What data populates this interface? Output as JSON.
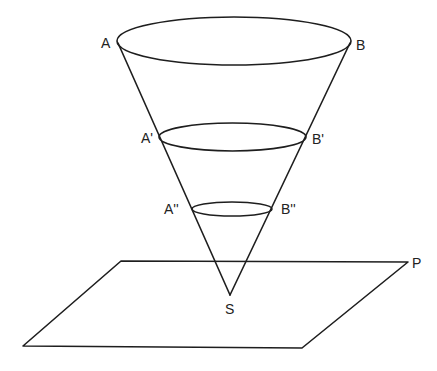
{
  "diagram": {
    "type": "cone-with-parallel-sections-above-plane",
    "colors": {
      "stroke": "#1e1e1e",
      "label": "#222222",
      "background": "#ffffff"
    },
    "labels": {
      "A": "A",
      "B": "B",
      "A1": "A'",
      "B1": "B'",
      "A2": "A''",
      "B2": "B''",
      "S": "S",
      "P": "P"
    },
    "apex": {
      "name": "S",
      "x": 230,
      "y": 295
    },
    "sections": [
      {
        "name": "AB",
        "left": "A",
        "right": "B",
        "cx": 234,
        "cy": 41,
        "rx": 117,
        "ry": 24
      },
      {
        "name": "A'B'",
        "left": "A'",
        "right": "B'",
        "cx": 232.5,
        "cy": 137,
        "rx": 73.5,
        "ry": 14
      },
      {
        "name": "A''B''",
        "left": "A''",
        "right": "B''",
        "cx": 232,
        "cy": 209,
        "rx": 40,
        "ry": 7
      }
    ],
    "plane": {
      "name": "P",
      "corners": [
        [
          121,
          261
        ],
        [
          408,
          262
        ],
        [
          302,
          348
        ],
        [
          23,
          346
        ]
      ]
    }
  }
}
